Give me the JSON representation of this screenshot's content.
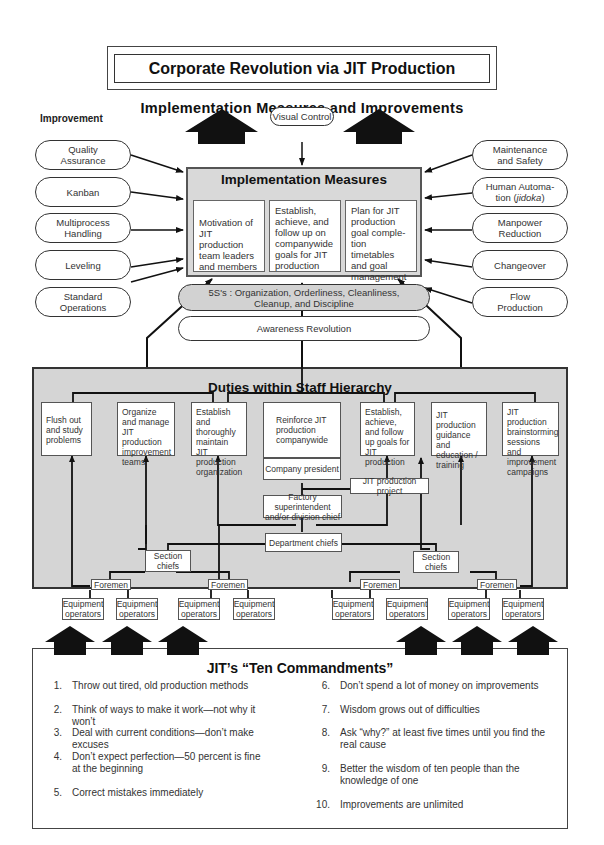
{
  "title": "Corporate Revolution via JIT Production",
  "section_heading": "Implementation Measures and Improvements",
  "improvement_label": "Improvement",
  "visual_control": "Visual Control",
  "left_improvements": [
    {
      "line1": "Quality",
      "line2": "Assurance"
    },
    {
      "line1": "Kanban",
      "line2": ""
    },
    {
      "line1": "Multiprocess",
      "line2": "Handling"
    },
    {
      "line1": "Leveling",
      "line2": ""
    },
    {
      "line1": "Standard",
      "line2": "Operations"
    }
  ],
  "right_improvements": [
    {
      "line1": "Maintenance",
      "line2": "and Safety"
    },
    {
      "line1": "Human Automa-",
      "line2": "tion (",
      "italic": "jidoka",
      "suffix": ")"
    },
    {
      "line1": "Manpower",
      "line2": "Reduction"
    },
    {
      "line1": "Changeover",
      "line2": ""
    },
    {
      "line1": "Flow",
      "line2": "Production"
    }
  ],
  "implementation": {
    "title": "Implementation Measures",
    "measures": [
      "Motivation of JIT production team leaders and members",
      "Establish, achieve, and follow up on companywide goals for JIT production",
      "Plan for JIT production goal comple- tion timetables and goal management"
    ]
  },
  "five_s": {
    "line1": "5S's : Organization, Orderliness, Cleanliness,",
    "line2": "Cleanup, and Discipline"
  },
  "awareness": "Awareness Revolution",
  "duties": {
    "title": "Duties within Staff Hierarchy",
    "items": [
      "Flush out and study problems",
      "Organize and manage JIT production improvement teams",
      "Establish and thoroughly maintain JIT production organization",
      "Reinforce JIT production companywide",
      "Establish, achieve, and follow up goals for JIT production",
      "JIT production guidance and education / training",
      "JIT production brainstorming sessions and improvement campaigns"
    ],
    "company_president": "Company president",
    "jit_project": "JIT production project",
    "factory_superintendent": "Factory superintendent and/or division chief",
    "department_chiefs": "Department chiefs",
    "section_chiefs": "Section chiefs",
    "foremen": "Foremen",
    "equipment_operators": "Equipment operators"
  },
  "commandments": {
    "title": "JIT’s “Ten Commandments”",
    "items": [
      {
        "num": "1.",
        "text": "Throw out tired, old production methods"
      },
      {
        "num": "2.",
        "text": "Think of ways to make it work—not why it won’t"
      },
      {
        "num": "3.",
        "text": "Deal with current conditions—don’t make excuses"
      },
      {
        "num": "4.",
        "text": "Don’t expect perfection—50 percent is fine at the beginning"
      },
      {
        "num": "5.",
        "text": "Correct mistakes immediately"
      },
      {
        "num": "6.",
        "text": "Don’t spend a lot of money on improvements"
      },
      {
        "num": "7.",
        "text": "Wisdom grows out of difficulties"
      },
      {
        "num": "8.",
        "text": "Ask “why?” at least five times until you find the real cause"
      },
      {
        "num": "9.",
        "text": "Better the wisdom of ten people than the knowledge of one"
      },
      {
        "num": "10.",
        "text": "Improvements are unlimited"
      }
    ]
  }
}
